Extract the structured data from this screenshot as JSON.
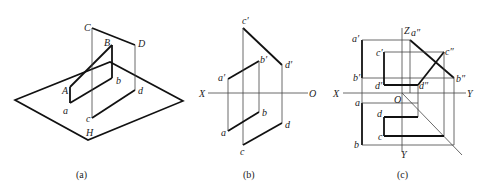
{
  "figure": {
    "panels": [
      {
        "id": "a",
        "caption": "(a)",
        "labels": {
          "C": "C",
          "D": "D",
          "B": "B",
          "A": "A",
          "a": "a",
          "b": "b",
          "c": "c",
          "d": "d",
          "H": "H"
        }
      },
      {
        "id": "b",
        "caption": "(b)",
        "labels": {
          "c_prime": "c′",
          "d_prime": "d′",
          "b_prime": "b′",
          "a_prime": "a′",
          "X": "X",
          "O": "O",
          "a": "a",
          "b": "b",
          "c": "c",
          "d": "d"
        }
      },
      {
        "id": "c",
        "caption": "(c)",
        "labels": {
          "Z": "Z",
          "X": "X",
          "Y_right": "Y",
          "Y_bottom": "Y",
          "O": "O",
          "a_prime": "a′",
          "a_dprime": "a″",
          "c_prime": "c′",
          "c_dprime": "c″",
          "b_prime": "b′",
          "b_dprime": "b″",
          "d_prime": "d′",
          "d_dprime": "d″",
          "a": "a",
          "d": "d",
          "c": "c",
          "b": "b"
        }
      }
    ]
  }
}
